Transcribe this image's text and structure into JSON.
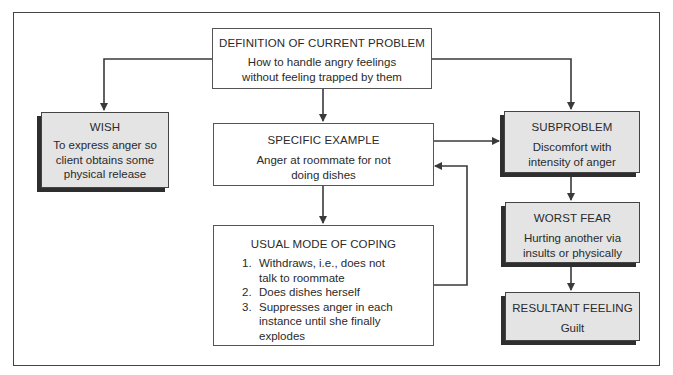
{
  "diagram": {
    "nodes": {
      "definition": {
        "title": "DEFINITION OF CURRENT PROBLEM",
        "body_lines": [
          "How to handle angry feelings",
          "without feeling trapped by them"
        ]
      },
      "wish": {
        "title": "WISH",
        "body_lines": [
          "To express anger so",
          "client obtains some",
          "physical release"
        ]
      },
      "specific_example": {
        "title": "SPECIFIC EXAMPLE",
        "body_lines": [
          "Anger at roommate for not",
          "doing dishes"
        ]
      },
      "usual_mode": {
        "title": "USUAL MODE OF COPING",
        "items": [
          {
            "num": "1.",
            "lines": [
              "Withdraws, i.e., does not",
              "talk to roommate"
            ]
          },
          {
            "num": "2.",
            "lines": [
              "Does dishes herself"
            ]
          },
          {
            "num": "3.",
            "lines": [
              "Suppresses anger in each",
              "instance until she finally",
              "explodes"
            ]
          }
        ]
      },
      "subproblem": {
        "title": "SUBPROBLEM",
        "body_lines": [
          "Discomfort with",
          "intensity of anger"
        ]
      },
      "worst_fear": {
        "title": "WORST FEAR",
        "body_lines": [
          "Hurting another via",
          "insults or physically"
        ]
      },
      "resultant_feeling": {
        "title": "RESULTANT FEELING",
        "body_lines": [
          "Guilt"
        ]
      }
    },
    "edges": [
      {
        "from": "definition",
        "to": "wish"
      },
      {
        "from": "definition",
        "to": "specific_example"
      },
      {
        "from": "definition",
        "to": "subproblem"
      },
      {
        "from": "specific_example",
        "to": "subproblem"
      },
      {
        "from": "specific_example",
        "to": "usual_mode"
      },
      {
        "from": "usual_mode",
        "to": "specific_example"
      },
      {
        "from": "subproblem",
        "to": "worst_fear"
      },
      {
        "from": "worst_fear",
        "to": "resultant_feeling"
      }
    ],
    "colors": {
      "line": "#3a3a3a",
      "shaded_fill": "#e4e4e4",
      "shadow": "#2e2e2e"
    }
  }
}
